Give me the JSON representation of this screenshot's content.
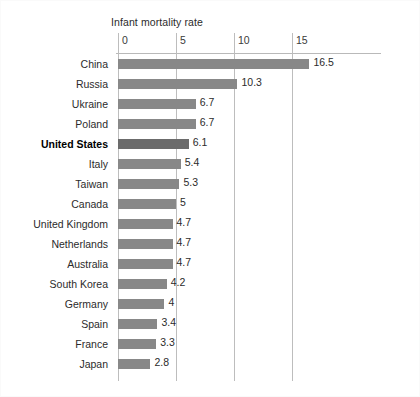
{
  "chart_data": {
    "type": "bar",
    "orientation": "horizontal",
    "title": "Infant mortality rate",
    "xlabel": "",
    "ylabel": "",
    "xlim": [
      0,
      18
    ],
    "xticks": [
      0,
      5,
      10,
      15
    ],
    "xtick_labels": [
      "0",
      "5",
      "10",
      "15"
    ],
    "grid": true,
    "legend": false,
    "highlight_category": "United States",
    "categories": [
      "China",
      "Russia",
      "Ukraine",
      "Poland",
      "United States",
      "Italy",
      "Taiwan",
      "Canada",
      "United Kingdom",
      "Netherlands",
      "Australia",
      "South Korea",
      "Germany",
      "Spain",
      "France",
      "Japan"
    ],
    "values": [
      16.5,
      10.3,
      6.7,
      6.7,
      6.1,
      5.4,
      5.3,
      5,
      4.7,
      4.7,
      4.7,
      4.2,
      4,
      3.4,
      3.3,
      2.8
    ],
    "value_labels": [
      "16.5",
      "10.3",
      "6.7",
      "6.7",
      "6.1",
      "5.4",
      "5.3",
      "5",
      "4.7",
      "4.7",
      "4.7",
      "4.2",
      "4",
      "3.4",
      "3.3",
      "2.8"
    ],
    "colors": {
      "bar": "#888888",
      "bar_highlight": "#6b6b6b",
      "gridline": "#bdbdbd",
      "text": "#2b2b2b",
      "background": "#ffffff"
    }
  }
}
